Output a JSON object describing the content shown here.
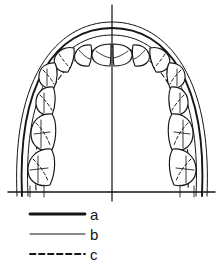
{
  "figure": {
    "midline": {
      "label": "midline-axis",
      "x": 112,
      "y_top": 5,
      "y_bottom": 201
    },
    "baseline": {
      "label": "horizontal-reference-line",
      "y": 192,
      "x_start": 8,
      "x_end": 215
    },
    "curves": [
      {
        "key": "a",
        "style": "thick-solid",
        "name": "outer-arch-curve"
      },
      {
        "key": "b",
        "style": "thin-solid",
        "name": "middle-arch-curve"
      },
      {
        "key": "c",
        "style": "dashed",
        "name": "inner-arch-curve"
      }
    ],
    "teeth": {
      "left_count": 8,
      "right_count": 8,
      "total": 16
    }
  },
  "legend": {
    "name": "line-style-legend",
    "entries": [
      {
        "id": "a",
        "label": "a",
        "style": "thick-solid",
        "color": "#151515"
      },
      {
        "id": "b",
        "label": "b",
        "style": "thin-solid",
        "color": "#151515"
      },
      {
        "id": "c",
        "label": "c",
        "style": "dashed",
        "color": "#151515"
      }
    ]
  },
  "colors": {
    "ink": "#151515",
    "background": "#ffffff"
  }
}
